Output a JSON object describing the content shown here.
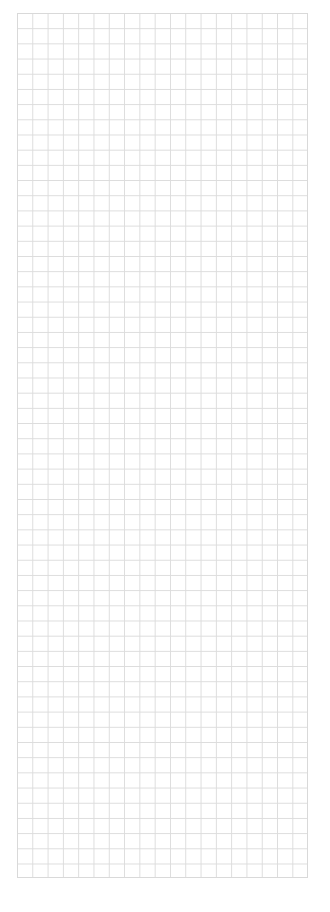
{
  "page": {
    "title": "",
    "type": "blank graph paper"
  },
  "grid": {
    "columns": 19,
    "rows": 57,
    "line_color": "#dcdcdc",
    "background": "#ffffff"
  }
}
